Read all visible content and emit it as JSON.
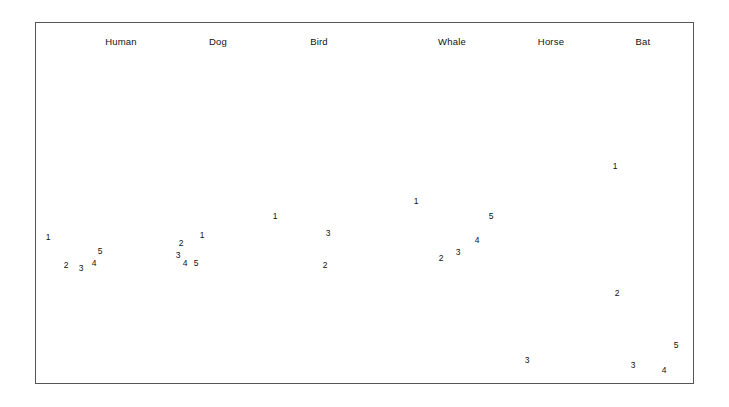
{
  "figure": {
    "title_present": false,
    "background_color": "#ffffff",
    "frame_color": "#555555",
    "bone_fill_light": "#e3e2de",
    "bone_fill_mid": "#cbcac4",
    "bone_fill_dark": "#a9a8a2",
    "outline_color": "#2b2b2b"
  },
  "specimens": [
    {
      "name": "Human",
      "label": "Human",
      "label_x": 121,
      "label_y": 36,
      "limb_type": "arm",
      "digits": [
        {
          "label": "1",
          "x": 48,
          "y": 237
        },
        {
          "label": "2",
          "x": 66,
          "y": 265
        },
        {
          "label": "3",
          "x": 81,
          "y": 268
        },
        {
          "label": "4",
          "x": 94,
          "y": 263
        },
        {
          "label": "5",
          "x": 100,
          "y": 251
        }
      ]
    },
    {
      "name": "Dog",
      "label": "Dog",
      "label_x": 218,
      "label_y": 36,
      "limb_type": "foreleg",
      "digits": [
        {
          "label": "1",
          "x": 202,
          "y": 235
        },
        {
          "label": "2",
          "x": 181,
          "y": 243
        },
        {
          "label": "3",
          "x": 178,
          "y": 255
        },
        {
          "label": "4",
          "x": 185,
          "y": 263
        },
        {
          "label": "5",
          "x": 196,
          "y": 263
        }
      ]
    },
    {
      "name": "Bird",
      "label": "Bird",
      "label_x": 319,
      "label_y": 36,
      "limb_type": "wing",
      "digits": [
        {
          "label": "1",
          "x": 275,
          "y": 216
        },
        {
          "label": "2",
          "x": 325,
          "y": 265
        },
        {
          "label": "3",
          "x": 328,
          "y": 233
        }
      ]
    },
    {
      "name": "Whale",
      "label": "Whale",
      "label_x": 452,
      "label_y": 36,
      "limb_type": "flipper",
      "digits": [
        {
          "label": "1",
          "x": 416,
          "y": 201
        },
        {
          "label": "2",
          "x": 441,
          "y": 258
        },
        {
          "label": "3",
          "x": 458,
          "y": 252
        },
        {
          "label": "4",
          "x": 477,
          "y": 240
        },
        {
          "label": "5",
          "x": 491,
          "y": 216
        }
      ]
    },
    {
      "name": "Horse",
      "label": "Horse",
      "label_x": 551,
      "label_y": 36,
      "limb_type": "leg",
      "digits": [
        {
          "label": "3",
          "x": 527,
          "y": 360
        }
      ]
    },
    {
      "name": "Bat",
      "label": "Bat",
      "label_x": 643,
      "label_y": 36,
      "limb_type": "wing",
      "digits": [
        {
          "label": "1",
          "x": 615,
          "y": 166
        },
        {
          "label": "2",
          "x": 617,
          "y": 293
        },
        {
          "label": "3",
          "x": 633,
          "y": 365
        },
        {
          "label": "4",
          "x": 664,
          "y": 370
        },
        {
          "label": "5",
          "x": 676,
          "y": 345
        }
      ]
    }
  ]
}
